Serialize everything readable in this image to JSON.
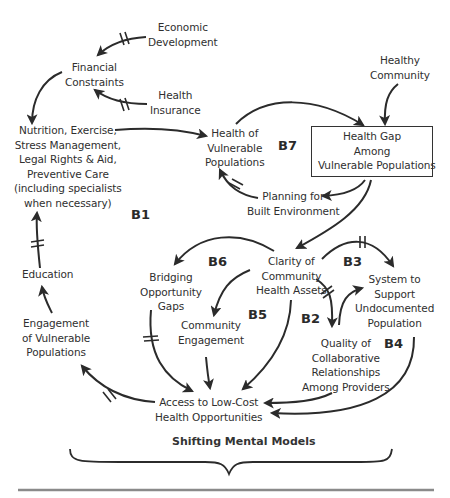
{
  "diagram": {
    "type": "causal-loop-diagram",
    "nodes": {
      "economic_development": {
        "lines": [
          "Economic",
          "Development"
        ]
      },
      "financial_constraints": {
        "lines": [
          "Financial",
          "Constraints"
        ]
      },
      "health_insurance": {
        "lines": [
          "Health",
          "Insurance"
        ]
      },
      "healthy_community": {
        "lines": [
          "Healthy",
          "Community"
        ]
      },
      "nutrition": {
        "lines": [
          "Nutrition, Exercise,",
          "Stress Management,",
          "Legal Rights & Aid,",
          "Preventive Care",
          "(including specialists",
          "when necessary)"
        ]
      },
      "health_vulnerable": {
        "lines": [
          "Health of",
          "Vulnerable",
          "Populations"
        ]
      },
      "health_gap": {
        "lines": [
          "Health Gap",
          "Among",
          "Vulnerable Populations"
        ]
      },
      "planning": {
        "lines": [
          "Planning for",
          "Built Environment"
        ]
      },
      "education": {
        "lines": [
          "Education"
        ]
      },
      "clarity": {
        "lines": [
          "Clarity of",
          "Community",
          "Health Assets"
        ]
      },
      "bridging": {
        "lines": [
          "Bridging",
          "Opportunity",
          "Gaps"
        ]
      },
      "system_undocumented": {
        "lines": [
          "System to",
          "Support",
          "Undocumented",
          "Population"
        ]
      },
      "community_engagement": {
        "lines": [
          "Community",
          "Engagement"
        ]
      },
      "engagement_vulnerable": {
        "lines": [
          "Engagement",
          "of Vulnerable",
          "Populations"
        ]
      },
      "quality_collab": {
        "lines": [
          "Quality of",
          "Collaborative",
          "Relationships",
          "Among Providers"
        ]
      },
      "access": {
        "lines": [
          "Access to Low-Cost",
          "Health Opportunities"
        ]
      }
    },
    "loops": {
      "b1": "B1",
      "b2": "B2",
      "b3": "B3",
      "b4": "B4",
      "b5": "B5",
      "b6": "B6",
      "b7": "B7"
    },
    "edges": [
      {
        "from": "Economic Development",
        "to": "Financial Constraints",
        "delay": true
      },
      {
        "from": "Health Insurance",
        "to": "Financial Constraints",
        "delay": true
      },
      {
        "from": "Financial Constraints",
        "to": "Nutrition, Exercise, ...",
        "delay": false
      },
      {
        "from": "Nutrition, Exercise, ...",
        "to": "Health of Vulnerable Populations",
        "delay": false
      },
      {
        "from": "Health of Vulnerable Populations",
        "to": "Health Gap Among Vulnerable Populations",
        "delay": false
      },
      {
        "from": "Healthy Community",
        "to": "Health Gap Among Vulnerable Populations",
        "delay": false
      },
      {
        "from": "Health Gap Among Vulnerable Populations",
        "to": "Planning for Built Environment",
        "delay": false
      },
      {
        "from": "Planning for Built Environment",
        "to": "Health of Vulnerable Populations",
        "delay": true
      },
      {
        "from": "Health Gap Among Vulnerable Populations",
        "to": "Clarity of Community Health Assets",
        "delay": false
      },
      {
        "from": "Clarity of Community Health Assets",
        "to": "Bridging Opportunity Gaps",
        "delay": false
      },
      {
        "from": "Clarity of Community Health Assets",
        "to": "Community Engagement",
        "delay": false
      },
      {
        "from": "Clarity of Community Health Assets",
        "to": "Access to Low-Cost Health Opportunities",
        "delay": false
      },
      {
        "from": "Clarity of Community Health Assets",
        "to": "System to Support Undocumented Population",
        "delay": true
      },
      {
        "from": "Clarity of Community Health Assets",
        "to": "Quality of Collaborative Relationships Among Providers",
        "delay": true
      },
      {
        "from": "Quality of Collaborative Relationships Among Providers",
        "to": "System to Support Undocumented Population",
        "delay": false
      },
      {
        "from": "Quality of Collaborative Relationships Among Providers",
        "to": "Access to Low-Cost Health Opportunities",
        "delay": false
      },
      {
        "from": "System to Support Undocumented Population",
        "to": "Access to Low-Cost Health Opportunities",
        "delay": false
      },
      {
        "from": "Bridging Opportunity Gaps",
        "to": "Access to Low-Cost Health Opportunities",
        "delay": true
      },
      {
        "from": "Community Engagement",
        "to": "Access to Low-Cost Health Opportunities",
        "delay": false
      },
      {
        "from": "Access to Low-Cost Health Opportunities",
        "to": "Engagement of Vulnerable Populations",
        "delay": true
      },
      {
        "from": "Engagement of Vulnerable Populations",
        "to": "Education",
        "delay": false
      },
      {
        "from": "Education",
        "to": "Nutrition, Exercise, ...",
        "delay": true
      }
    ],
    "caption": "Shifting Mental Models",
    "colors": {
      "ink": "#2b2b2b",
      "background": "#ffffff",
      "rule": "#8a8a8a"
    }
  }
}
